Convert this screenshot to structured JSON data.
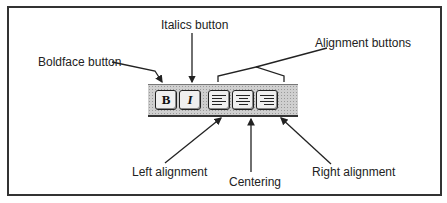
{
  "diagram": {
    "toolbar": {
      "buttons": [
        {
          "id": "bold",
          "glyph": "B"
        },
        {
          "id": "italic",
          "glyph": "I"
        },
        {
          "id": "align-left"
        },
        {
          "id": "align-center"
        },
        {
          "id": "align-right"
        }
      ]
    },
    "callouts": {
      "italics": "Italics button",
      "boldface": "Boldface button",
      "alignment": "Alignment buttons",
      "left": "Left alignment",
      "centering": "Centering",
      "right": "Right alignment"
    }
  }
}
